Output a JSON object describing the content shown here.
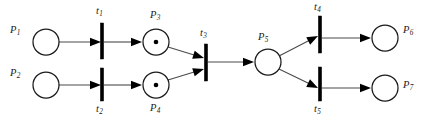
{
  "diagram": {
    "type": "petri-net",
    "title": "",
    "width": 421,
    "height": 127,
    "colors": {
      "background": "#ffffff",
      "stroke": "#1a1a1a",
      "arc": "#4a4a4a",
      "token": "#000000",
      "transition": "#000000"
    },
    "places": [
      {
        "id": "P1",
        "label": "P",
        "sub": "1",
        "cx": 46,
        "cy": 42,
        "r": 13,
        "tokens": 0,
        "label_x": 10,
        "label_y": 25
      },
      {
        "id": "P2",
        "label": "P",
        "sub": "2",
        "cx": 46,
        "cy": 85,
        "r": 13,
        "tokens": 0,
        "label_x": 10,
        "label_y": 68
      },
      {
        "id": "P3",
        "label": "P",
        "sub": "3",
        "cx": 156,
        "cy": 42,
        "r": 13,
        "tokens": 1,
        "label_x": 150,
        "label_y": 10
      },
      {
        "id": "P4",
        "label": "P",
        "sub": "4",
        "cx": 156,
        "cy": 85,
        "r": 13,
        "tokens": 1,
        "label_x": 150,
        "label_y": 103
      },
      {
        "id": "P5",
        "label": "P",
        "sub": "5",
        "cx": 268,
        "cy": 62,
        "r": 13,
        "tokens": 0,
        "label_x": 258,
        "label_y": 32
      },
      {
        "id": "P6",
        "label": "P",
        "sub": "6",
        "cx": 385,
        "cy": 38,
        "r": 13,
        "tokens": 0,
        "label_x": 403,
        "label_y": 25
      },
      {
        "id": "P7",
        "label": "P",
        "sub": "7",
        "cx": 385,
        "cy": 88,
        "r": 13,
        "tokens": 0,
        "label_x": 403,
        "label_y": 80
      }
    ],
    "transitions": [
      {
        "id": "t1",
        "label": "t",
        "sub": "1",
        "x": 102,
        "y1": 23,
        "y2": 59,
        "label_x": 96,
        "label_y": 6
      },
      {
        "id": "t2",
        "label": "t",
        "sub": "2",
        "x": 102,
        "y1": 68,
        "y2": 101,
        "label_x": 96,
        "label_y": 104
      },
      {
        "id": "t3",
        "label": "t",
        "sub": "3",
        "x": 206,
        "y1": 44,
        "y2": 81,
        "label_x": 200,
        "label_y": 28
      },
      {
        "id": "t4",
        "label": "t",
        "sub": "4",
        "x": 320,
        "y1": 16,
        "y2": 53,
        "label_x": 314,
        "label_y": 2
      },
      {
        "id": "t5",
        "label": "t",
        "sub": "5",
        "x": 320,
        "y1": 67,
        "y2": 101,
        "label_x": 314,
        "label_y": 104
      }
    ],
    "arcs": [
      {
        "from": "P1",
        "to": "t1",
        "x1": 59,
        "y1": 42,
        "x2": 101,
        "y2": 42
      },
      {
        "from": "t1",
        "to": "P3",
        "x1": 104,
        "y1": 42,
        "x2": 142,
        "y2": 42
      },
      {
        "from": "P2",
        "to": "t2",
        "x1": 59,
        "y1": 85,
        "x2": 101,
        "y2": 85
      },
      {
        "from": "t2",
        "to": "P4",
        "x1": 104,
        "y1": 85,
        "x2": 142,
        "y2": 85
      },
      {
        "from": "P3",
        "to": "t3",
        "x1": 168,
        "y1": 47,
        "x2": 204,
        "y2": 58
      },
      {
        "from": "P4",
        "to": "t3",
        "x1": 168,
        "y1": 80,
        "x2": 204,
        "y2": 69
      },
      {
        "from": "t3",
        "to": "P5",
        "x1": 208,
        "y1": 62,
        "x2": 254,
        "y2": 62
      },
      {
        "from": "P5",
        "to": "t4",
        "x1": 279,
        "y1": 56,
        "x2": 318,
        "y2": 36
      },
      {
        "from": "P5",
        "to": "t5",
        "x1": 279,
        "y1": 69,
        "x2": 318,
        "y2": 88
      },
      {
        "from": "t4",
        "to": "P6",
        "x1": 322,
        "y1": 38,
        "x2": 371,
        "y2": 38
      },
      {
        "from": "t5",
        "to": "P7",
        "x1": 322,
        "y1": 88,
        "x2": 371,
        "y2": 88
      }
    ]
  }
}
